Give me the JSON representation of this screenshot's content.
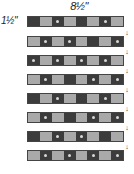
{
  "labels": {
    "width": "8½\"",
    "height": "1½\""
  },
  "colors": {
    "dark": "#3c3c3c",
    "light": "#a9a9a9",
    "border": "#444444"
  },
  "arrow_glyph": "↓",
  "strips": [
    {
      "pattern": [
        "D",
        "L",
        "D",
        "L",
        "D",
        "L",
        "D",
        "L"
      ],
      "dots": [
        2,
        6
      ]
    },
    {
      "pattern": [
        "L",
        "D",
        "L",
        "D",
        "L",
        "D",
        "L",
        "D"
      ],
      "dots": [
        1,
        3,
        7
      ]
    },
    {
      "pattern": [
        "D",
        "L",
        "D",
        "L",
        "D",
        "L",
        "D",
        "L"
      ],
      "dots": [
        0,
        2,
        4,
        6
      ]
    },
    {
      "pattern": [
        "L",
        "D",
        "L",
        "D",
        "L",
        "D",
        "L",
        "D"
      ],
      "dots": [
        1,
        5,
        7
      ]
    },
    {
      "pattern": [
        "D",
        "L",
        "D",
        "L",
        "D",
        "L",
        "D",
        "L"
      ],
      "dots": [
        2,
        6
      ]
    },
    {
      "pattern": [
        "L",
        "D",
        "L",
        "D",
        "L",
        "D",
        "L",
        "D"
      ],
      "dots": [
        1,
        5,
        7
      ]
    },
    {
      "pattern": [
        "D",
        "L",
        "D",
        "L",
        "D",
        "L",
        "D",
        "L"
      ],
      "dots": [
        2,
        4
      ]
    },
    {
      "pattern": [
        "L",
        "D",
        "L",
        "D",
        "L",
        "D",
        "L",
        "D"
      ],
      "dots": [
        1,
        3,
        5,
        7
      ]
    }
  ]
}
